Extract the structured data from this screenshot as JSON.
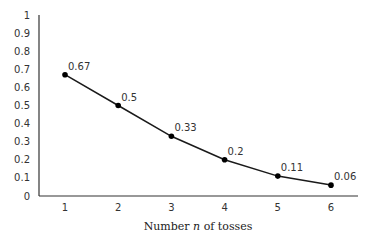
{
  "chart_data": {
    "type": "line",
    "title": "",
    "xlabel": "Number n of tosses",
    "xlabel_parts": {
      "before": "Number ",
      "italic": "n",
      "after": " of tosses"
    },
    "ylabel": "",
    "x": [
      1,
      2,
      3,
      4,
      5,
      6
    ],
    "categories": [
      "1",
      "2",
      "3",
      "4",
      "5",
      "6"
    ],
    "series": [
      {
        "name": "probability",
        "values": [
          0.67,
          0.5,
          0.33,
          0.2,
          0.11,
          0.06
        ]
      }
    ],
    "data_labels": [
      "0.67",
      "0.5",
      "0.33",
      "0.2",
      "0.11",
      "0.06"
    ],
    "ylim": [
      0,
      1
    ],
    "yticks": [
      "0",
      "0.1",
      "0.2",
      "0.3",
      "0.4",
      "0.5",
      "0.6",
      "0.7",
      "0.8",
      "0.9",
      "1"
    ],
    "grid": false,
    "legend": null,
    "colors": {
      "line": "#1a1a1a",
      "marker": "#000000",
      "axis": "#333333"
    }
  }
}
